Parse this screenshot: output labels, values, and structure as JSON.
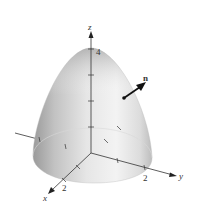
{
  "figure": {
    "surface": "z = 4 - x^2 - y^2",
    "axes": {
      "x": {
        "label": "x",
        "tick_label": "2"
      },
      "y": {
        "label": "y",
        "tick_label": "2"
      },
      "z": {
        "label": "z",
        "tick_label": "4"
      }
    },
    "vector": {
      "label": "n"
    },
    "colors": {
      "surface_light": "#f2f2f2",
      "surface_mid": "#c8c8c8",
      "surface_dark": "#8f8f8f",
      "axis": "#333333",
      "vector": "#111111"
    }
  }
}
